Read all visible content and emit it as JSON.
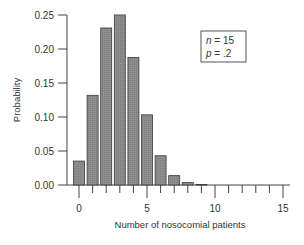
{
  "chart_data": {
    "type": "bar",
    "title": "",
    "xlabel": "Number of nosocomial patients",
    "ylabel": "Probability",
    "categories": [
      0,
      1,
      2,
      3,
      4,
      5,
      6,
      7,
      8,
      9,
      10,
      11,
      12,
      13,
      14,
      15
    ],
    "values": [
      0.0352,
      0.1319,
      0.2309,
      0.2501,
      0.1876,
      0.1032,
      0.043,
      0.0138,
      0.0035,
      0.0007,
      0.0001,
      0.0,
      0.0,
      0.0,
      0.0,
      0.0
    ],
    "ylim": [
      0,
      0.25
    ],
    "xlim": [
      0,
      15
    ],
    "yticks": [
      "0.00",
      "0.05",
      "0.10",
      "0.15",
      "0.20",
      "0.25"
    ],
    "yticks_values": [
      0,
      0.05,
      0.1,
      0.15,
      0.2,
      0.25
    ],
    "xticks_labeled": [
      "0",
      "5",
      "10",
      "15"
    ],
    "xticks_labeled_values": [
      0,
      5,
      10,
      15
    ],
    "grid": false,
    "legend": {
      "position": "upper-right",
      "lines": [
        {
          "var": "n",
          "eq": " = 15"
        },
        {
          "var": "p",
          "eq": " = .2"
        }
      ]
    },
    "colors": {
      "bar_fill": "#8c8c8c",
      "bar_stroke": "#3a3a3a",
      "axis": "#444444",
      "text": "#333333"
    }
  }
}
